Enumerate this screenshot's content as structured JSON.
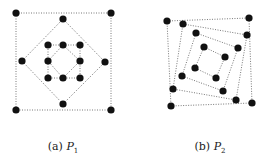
{
  "figure": {
    "panels": [
      {
        "id": "a",
        "caption_prefix": "(a)",
        "caption_var": "P",
        "caption_sub": "1",
        "caption_x": 63,
        "polygons": [
          [
            [
              16,
              13
            ],
            [
              111,
              13
            ],
            [
              111,
              110
            ],
            [
              16,
              110
            ]
          ],
          [
            [
              63,
              19
            ],
            [
              105,
              62
            ],
            [
              63,
              104
            ],
            [
              22,
              61
            ]
          ],
          [
            [
              48,
              45
            ],
            [
              80,
              45
            ],
            [
              80,
              78
            ],
            [
              48,
              78
            ]
          ],
          [
            [
              63,
              45
            ],
            [
              80,
              61
            ],
            [
              63,
              78
            ],
            [
              48,
              61
            ]
          ]
        ],
        "points": [
          [
            16,
            13
          ],
          [
            111,
            13
          ],
          [
            16,
            110
          ],
          [
            111,
            110
          ],
          [
            63,
            19
          ],
          [
            22,
            61
          ],
          [
            105,
            62
          ],
          [
            63,
            104
          ],
          [
            48,
            45
          ],
          [
            63,
            45
          ],
          [
            80,
            45
          ],
          [
            48,
            61
          ],
          [
            80,
            61
          ],
          [
            48,
            78
          ],
          [
            63,
            78
          ],
          [
            80,
            78
          ]
        ]
      },
      {
        "id": "b",
        "caption_prefix": "(b)",
        "caption_var": "P",
        "caption_sub": "2",
        "caption_x": 210,
        "polygons": [
          [
            [
              167,
              21
            ],
            [
              249,
              18
            ],
            [
              252,
              103
            ],
            [
              171,
              106
            ]
          ],
          [
            [
              183,
              24
            ],
            [
              247,
              35
            ],
            [
              236,
              100
            ],
            [
              173,
              89
            ]
          ],
          [
            [
              196,
              33
            ],
            [
              238,
              48
            ],
            [
              223,
              91
            ],
            [
              182,
              76
            ]
          ],
          [
            [
              204,
              47
            ],
            [
              225,
              57
            ],
            [
              216,
              78
            ],
            [
              195,
              68
            ]
          ]
        ],
        "points": [
          [
            167,
            21
          ],
          [
            249,
            18
          ],
          [
            252,
            103
          ],
          [
            171,
            106
          ],
          [
            183,
            24
          ],
          [
            247,
            35
          ],
          [
            236,
            100
          ],
          [
            173,
            89
          ],
          [
            196,
            33
          ],
          [
            238,
            48
          ],
          [
            223,
            91
          ],
          [
            182,
            76
          ],
          [
            204,
            47
          ],
          [
            225,
            57
          ],
          [
            216,
            78
          ],
          [
            195,
            68
          ]
        ]
      }
    ],
    "colors": {
      "point": "#111111",
      "line": "#555555"
    }
  }
}
